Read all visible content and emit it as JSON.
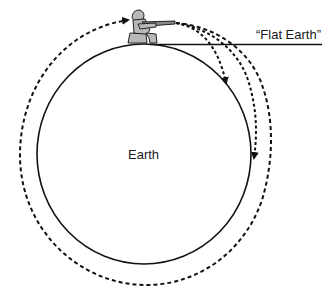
{
  "diagram": {
    "type": "newtons-cannonball",
    "labels": {
      "earth": "Earth",
      "flat_earth": "“Flat Earth”"
    },
    "elements": {
      "earth_circle": "solid circle representing Earth",
      "flat_earth_line": "horizontal tangent line",
      "cannoneer": "kneeling figure firing rifle",
      "trajectories": [
        {
          "name": "short-trajectory",
          "description": "falls to Earth near launch",
          "style": "dashed",
          "arrow": true
        },
        {
          "name": "medium-trajectory",
          "description": "falls to Earth farther away",
          "style": "dashed",
          "arrow": true
        },
        {
          "name": "orbit-trajectory",
          "description": "full orbit around Earth returning to launch point",
          "style": "dashed",
          "arrow": true
        }
      ]
    },
    "colors": {
      "line": "#111111",
      "figure_fill": "#b8b8b8",
      "background": "#ffffff"
    }
  }
}
